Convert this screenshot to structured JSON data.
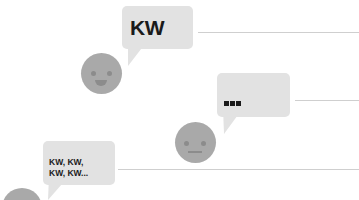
{
  "colors": {
    "bubble": "#e2e2e2",
    "face": "#a9a9a9",
    "face_feature": "#8c8c8c",
    "text": "#1a1a1a",
    "line": "#cfcfcf",
    "background": "#ffffff"
  },
  "conversation": [
    {
      "speaker_expression": "smiling",
      "bubble_text": "KW",
      "face_icon": "smiling-face-icon"
    },
    {
      "speaker_expression": "neutral",
      "bubble_text": "...",
      "face_icon": "neutral-face-icon"
    },
    {
      "speaker_expression": "partial",
      "bubble_lines": [
        "KW, KW,",
        "KW, KW..."
      ],
      "face_icon": "face-icon"
    }
  ]
}
